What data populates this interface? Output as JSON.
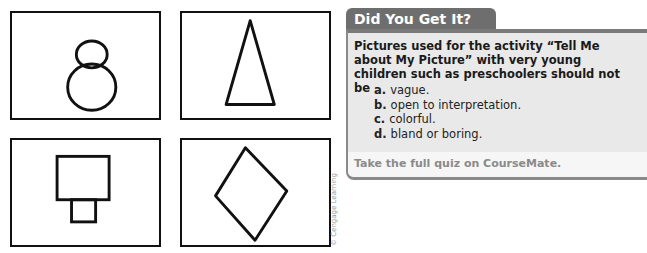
{
  "figure": {
    "panels": [
      {
        "shape": "two-circles-figure-eight"
      },
      {
        "shape": "tall-triangle"
      },
      {
        "shape": "square-on-small-rectangle"
      },
      {
        "shape": "diamond"
      }
    ],
    "credit": "© Cengage Learning"
  },
  "quiz": {
    "title": "Did You Get It?",
    "question": "Pictures used for the activity “Tell Me about My Picture” with very young children such as preschoolers should not be",
    "options": [
      {
        "letter": "a.",
        "text": "vague."
      },
      {
        "letter": "b.",
        "text": "open to interpretation."
      },
      {
        "letter": "c.",
        "text": "colorful."
      },
      {
        "letter": "d.",
        "text": "bland or boring."
      }
    ],
    "footer": "Take the full quiz on CourseMate."
  }
}
